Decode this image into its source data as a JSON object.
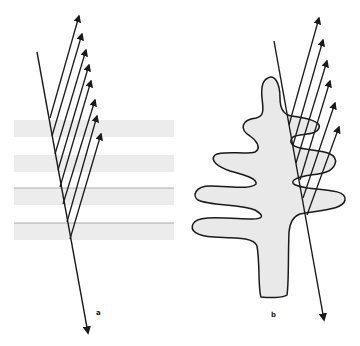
{
  "figure": {
    "panels": [
      {
        "id": "a",
        "label": "a",
        "description": "Ray reflected by multiple horizontal thin-film layers",
        "layers": 4,
        "reflected_rays": 8
      },
      {
        "id": "b",
        "label": "b",
        "description": "Ray reflected by lobed (tree-like) lamellar structure",
        "reflected_rays": 6
      }
    ],
    "colors": {
      "line": "#1a1a1a",
      "layer_fill": "#ececec",
      "layer_edge": "#9a9a9a",
      "shape_fill": "#e9e9e9"
    }
  }
}
